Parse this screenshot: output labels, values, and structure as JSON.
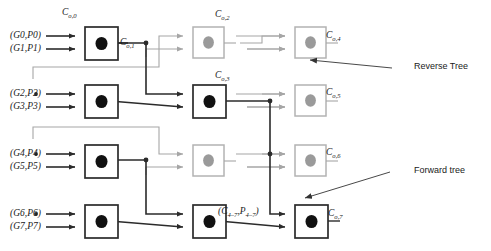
{
  "figure": {
    "type": "prefix-adder-tree-diagram",
    "background": "#ffffff",
    "width": 491,
    "height": 251
  },
  "colors": {
    "dark_node_stroke": "#2b2b2b",
    "dark_node_dot": "#111111",
    "light_node_stroke": "#b3b3b3",
    "light_node_dot": "#9a9a9a",
    "dark_wire": "#2b2b2b",
    "light_wire": "#a6a6a6",
    "text": "#1a1a1a"
  },
  "inputs": [
    {
      "id": "in0",
      "label": "(G",
      "sub1": "0",
      "mid": ",P",
      "sub2": "0",
      "close": ")"
    },
    {
      "id": "in1",
      "label": "(G",
      "sub1": "1",
      "mid": ",P",
      "sub2": "1",
      "close": ")"
    },
    {
      "id": "in2",
      "label": "(G",
      "sub1": "2",
      "mid": ",P",
      "sub2": "2",
      "close": ")"
    },
    {
      "id": "in3",
      "label": "(G",
      "sub1": "3",
      "mid": ",P",
      "sub2": "3",
      "close": ")"
    },
    {
      "id": "in4",
      "label": "(G",
      "sub1": "4",
      "mid": ",P",
      "sub2": "4",
      "close": ")"
    },
    {
      "id": "in5",
      "label": "(G",
      "sub1": "5",
      "mid": ",P",
      "sub2": "5",
      "close": ")"
    },
    {
      "id": "in6",
      "label": "(G",
      "sub1": "6",
      "mid": ",P",
      "sub2": "6",
      "close": ")"
    },
    {
      "id": "in7",
      "label": "(G",
      "sub1": "7",
      "mid": ",P",
      "sub2": "7",
      "close": ")"
    }
  ],
  "input_labels": {
    "in0": "(G0,P0)",
    "in1": "(G1,P1)",
    "in2": "(G2,P2)",
    "in3": "(G3,P3)",
    "in4": "(G4,P4)",
    "in5": "(G5,P5)",
    "in6": "(G6,P6)",
    "in7": "(G7,P7)"
  },
  "output_labels": {
    "c00": "C",
    "c00_sub": "o,0",
    "c01": "C",
    "c01_sub": "o,1",
    "c02": "C",
    "c02_sub": "o,2",
    "c03": "C",
    "c03_sub": "o,3",
    "c04": "C",
    "c04_sub": "o,4",
    "c05": "C",
    "c05_sub": "o,5",
    "c06": "C",
    "c06_sub": "o,6",
    "c07": "C",
    "c07_sub": "o,7"
  },
  "group_label": {
    "open": "(C",
    "sub1": "4–7",
    "mid": ",P",
    "sub2": "4–7",
    "close": ")"
  },
  "annotations": [
    {
      "id": "reverse-tree",
      "text": "Reverse Tree"
    },
    {
      "id": "forward-tree",
      "text": "Forward tree"
    }
  ],
  "nodes": [
    {
      "id": "node-0",
      "kind": "dark",
      "label": "C o,0",
      "x": 85,
      "y": 27
    },
    {
      "id": "node-1",
      "kind": "dark",
      "label": "C o,1",
      "x": 85,
      "y": 85
    },
    {
      "id": "node-2",
      "kind": "light",
      "label": "C o,2",
      "x": 193,
      "y": 27
    },
    {
      "id": "node-3",
      "kind": "dark",
      "label": "C o,3",
      "x": 193,
      "y": 85
    },
    {
      "id": "node-4",
      "kind": "light",
      "label": "C o,4",
      "x": 295,
      "y": 27
    },
    {
      "id": "node-5",
      "kind": "light",
      "label": "C o,5",
      "x": 295,
      "y": 85
    },
    {
      "id": "node-6",
      "kind": "dark",
      "label": "C o,6",
      "x": 85,
      "y": 145
    },
    {
      "id": "node-7",
      "kind": "dark",
      "label": "C o,7",
      "x": 85,
      "y": 205
    },
    {
      "id": "node-8",
      "kind": "light",
      "label": "",
      "x": 193,
      "y": 145
    },
    {
      "id": "node-9",
      "kind": "dark",
      "label": "",
      "x": 193,
      "y": 205
    },
    {
      "id": "node-10",
      "kind": "light",
      "label": "C o,6",
      "x": 295,
      "y": 145
    },
    {
      "id": "node-11",
      "kind": "dark",
      "label": "C o,7",
      "x": 295,
      "y": 205
    }
  ]
}
